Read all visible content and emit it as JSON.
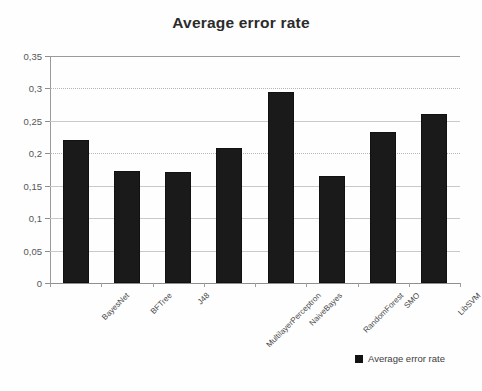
{
  "chart_data": {
    "type": "bar",
    "title": "Average error rate",
    "xlabel": "",
    "ylabel": "",
    "categories": [
      "BayesNet",
      "BFTree",
      "J48",
      "MultilayerPerceptron",
      "NaiveBayes",
      "RandomForest",
      "SMO",
      "LibSVM"
    ],
    "values": [
      0.22,
      0.173,
      0.171,
      0.208,
      0.294,
      0.165,
      0.233,
      0.261
    ],
    "series": [
      {
        "name": "Average error rate",
        "values": [
          0.22,
          0.173,
          0.171,
          0.208,
          0.294,
          0.165,
          0.233,
          0.261
        ]
      }
    ],
    "ylim": [
      0,
      0.35
    ],
    "ytick_values": [
      0.35,
      0.3,
      0.25,
      0.2,
      0.15,
      0.1,
      0.05,
      0
    ],
    "ytick_labels": [
      "0,35",
      "0,3",
      "0,25",
      "0,2",
      "0,15",
      "0,1",
      "0,05",
      "0"
    ],
    "grid": true,
    "grid_axis": "y",
    "legend": [
      "Average error rate"
    ],
    "legend_position": "bottom-right",
    "bar_color": "#1a1a1a"
  },
  "legend": {
    "label": "Average error rate",
    "swatch_name": "legend-swatch-average-error-rate"
  }
}
